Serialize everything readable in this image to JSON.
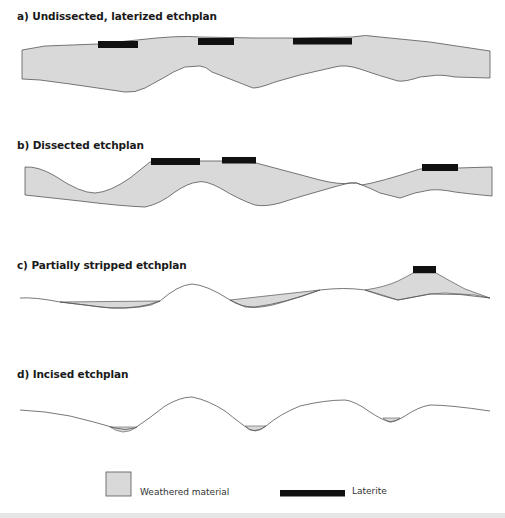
{
  "colors": {
    "weathered": "#d9d9d9",
    "laterite": "#111111",
    "outline": "#555555"
  },
  "panels": [
    {
      "id": "a",
      "title": "a) Undissected, laterized etchplan"
    },
    {
      "id": "b",
      "title": "b) Dissected etchplan"
    },
    {
      "id": "c",
      "title": "c) Partially stripped etchplan"
    },
    {
      "id": "d",
      "title": "d) Incised etchplan"
    }
  ],
  "legend": {
    "weathered_label": "Weathered material",
    "laterite_label": "Laterite"
  }
}
